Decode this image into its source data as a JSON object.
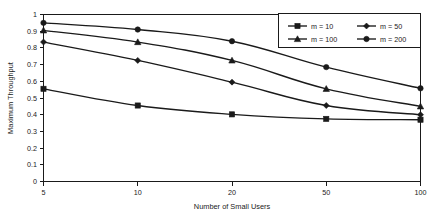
{
  "chart_data": {
    "type": "line",
    "title": "",
    "xlabel": "Number of Small Users",
    "ylabel": "Maximum Throughput",
    "categories": [
      "5",
      "10",
      "20",
      "50",
      "100"
    ],
    "x_tick_labels": [
      "5",
      "10",
      "20",
      "50",
      "100"
    ],
    "y_tick_labels": [
      "0",
      "0.1",
      "0.2",
      "0.3",
      "0.4",
      "0.5",
      "0.6",
      "0.7",
      "0.8",
      "0.9",
      "1"
    ],
    "y_ticks": [
      0,
      0.1,
      0.2,
      0.3,
      0.4,
      0.5,
      0.6,
      0.7,
      0.8,
      0.9,
      1
    ],
    "ylim": [
      0,
      1
    ],
    "grid": false,
    "legend_position": "top-right",
    "line_color": "#1a1a1a",
    "series": [
      {
        "name": "m = 10",
        "marker": "square",
        "values": [
          0.555,
          0.455,
          0.402,
          0.375,
          0.37
        ]
      },
      {
        "name": "m = 50",
        "marker": "diamond",
        "values": [
          0.835,
          0.725,
          0.595,
          0.455,
          0.4
        ]
      },
      {
        "name": "m = 100",
        "marker": "triangle",
        "values": [
          0.905,
          0.835,
          0.725,
          0.555,
          0.45
        ]
      },
      {
        "name": "m = 200",
        "marker": "circle",
        "values": [
          0.95,
          0.91,
          0.84,
          0.685,
          0.558
        ]
      }
    ]
  },
  "legend": {
    "entries": [
      {
        "label": "m = 10",
        "marker": "square"
      },
      {
        "label": "m = 50",
        "marker": "diamond"
      },
      {
        "label": "m = 100",
        "marker": "triangle"
      },
      {
        "label": "m = 200",
        "marker": "circle"
      }
    ]
  },
  "axes": {
    "x_title": "Number of Small Users",
    "y_title": "Maximum Throughput"
  }
}
